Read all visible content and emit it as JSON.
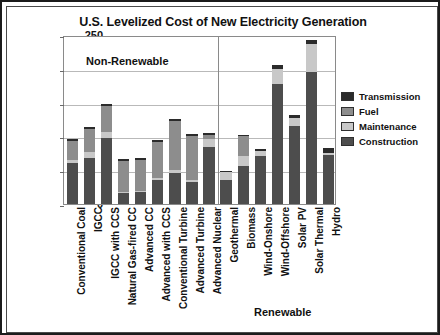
{
  "chart_data": {
    "type": "bar",
    "stacked": true,
    "title": "U.S. Levelized Cost of New Electricity Generation",
    "xlabel": "",
    "ylabel": "2012 $/MWh",
    "ylim": [
      0,
      250
    ],
    "yticks": [
      0,
      50,
      100,
      150,
      200,
      250
    ],
    "grid": true,
    "legend_position": "right",
    "categories": [
      "Conventional Coal",
      "IGCC",
      "IGCC with CCS",
      "Natural Gas-fired CC",
      "Advanced CC",
      "Advanced with CCS",
      "Conventional Turbine",
      "Advanced Turbine",
      "Advanced Nuclear",
      "Geothermal",
      "Biomass",
      "Wind-Onshore",
      "Wind-Offshore",
      "Solar PV",
      "Solar Thermal",
      "Hydro"
    ],
    "series": [
      {
        "name": "Construction",
        "color": "#4d4d4d",
        "values": [
          60,
          68,
          97,
          16,
          18,
          35,
          46,
          32,
          84,
          35,
          56,
          71,
          177,
          115,
          195,
          72
        ]
      },
      {
        "name": "Maintenance",
        "color": "#c8c8c8",
        "values": [
          5,
          9,
          10,
          2,
          2,
          4,
          4,
          3,
          12,
          13,
          15,
          8,
          23,
          12,
          42,
          4
        ]
      },
      {
        "name": "Fuel",
        "color": "#8d8d8d",
        "values": [
          28,
          34,
          38,
          45,
          45,
          53,
          73,
          65,
          6,
          0,
          29,
          0,
          0,
          0,
          0,
          0
        ]
      },
      {
        "name": "Transmission",
        "color": "#2b2b2b",
        "values": [
          3,
          3,
          3,
          3,
          3,
          3,
          3,
          3,
          3,
          1,
          2,
          3,
          6,
          4,
          6,
          7
        ]
      }
    ],
    "annotations": [
      {
        "text": "Non-Renewable",
        "position": "upper-left-of-plot"
      },
      {
        "text": "Renewable",
        "position": "below-right-of-plot"
      }
    ],
    "group_divider_after_category": "Advanced Nuclear"
  },
  "legend": {
    "items": [
      {
        "label": "Transmission",
        "color": "#2b2b2b"
      },
      {
        "label": "Fuel",
        "color": "#8d8d8d"
      },
      {
        "label": "Maintenance",
        "color": "#c8c8c8"
      },
      {
        "label": "Construction",
        "color": "#4d4d4d"
      }
    ]
  }
}
